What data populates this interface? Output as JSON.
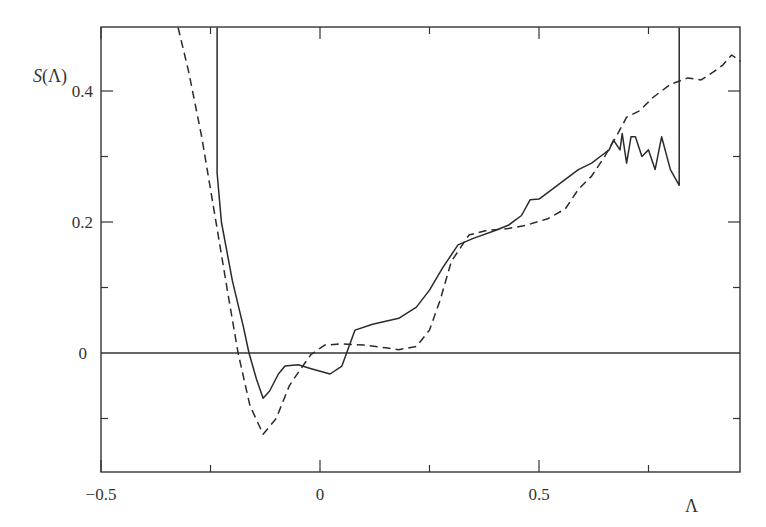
{
  "chart_data": {
    "type": "line",
    "title": "",
    "xlabel": "Λ",
    "ylabel": "S(Λ)",
    "xlim": [
      -0.5,
      0.96
    ],
    "ylim": [
      -0.183,
      0.497
    ],
    "grid": false,
    "legend": null,
    "x_ticks": [
      {
        "value": -0.5,
        "label": "−0.5"
      },
      {
        "value": -0.25,
        "label": ""
      },
      {
        "value": 0,
        "label": "0"
      },
      {
        "value": 0.25,
        "label": ""
      },
      {
        "value": 0.5,
        "label": "0.5"
      },
      {
        "value": 0.75,
        "label": ""
      }
    ],
    "y_ticks": [
      {
        "value": -0.1,
        "label": ""
      },
      {
        "value": 0,
        "label": "0"
      },
      {
        "value": 0.1,
        "label": ""
      },
      {
        "value": 0.2,
        "label": "0.2"
      },
      {
        "value": 0.3,
        "label": ""
      },
      {
        "value": 0.4,
        "label": "0.4"
      }
    ],
    "reference_lines": [
      {
        "axis": "y",
        "value": 0,
        "style": "solid"
      }
    ],
    "series": [
      {
        "name": "solid",
        "style": "solid",
        "x": [
          -0.235,
          -0.235,
          -0.225,
          -0.2,
          -0.175,
          -0.162,
          -0.145,
          -0.13,
          -0.115,
          -0.095,
          -0.08,
          -0.05,
          -0.02,
          0.023,
          0.05,
          0.08,
          0.12,
          0.18,
          0.22,
          0.25,
          0.28,
          0.315,
          0.35,
          0.4,
          0.43,
          0.46,
          0.48,
          0.5,
          0.53,
          0.56,
          0.59,
          0.62,
          0.64,
          0.66,
          0.67,
          0.685,
          0.69,
          0.7,
          0.71,
          0.72,
          0.735,
          0.75,
          0.765,
          0.78,
          0.8,
          0.82,
          0.82
        ],
        "y": [
          0.497,
          0.275,
          0.2,
          0.11,
          0.04,
          0.0,
          -0.04,
          -0.069,
          -0.058,
          -0.032,
          -0.02,
          -0.018,
          -0.024,
          -0.032,
          -0.02,
          0.035,
          0.044,
          0.053,
          0.07,
          0.096,
          0.13,
          0.165,
          0.175,
          0.187,
          0.195,
          0.21,
          0.234,
          0.235,
          0.25,
          0.265,
          0.28,
          0.29,
          0.3,
          0.31,
          0.325,
          0.31,
          0.335,
          0.29,
          0.33,
          0.33,
          0.3,
          0.31,
          0.28,
          0.33,
          0.28,
          0.256,
          0.497
        ]
      },
      {
        "name": "dashed",
        "style": "dashed",
        "x": [
          -0.324,
          -0.3,
          -0.27,
          -0.24,
          -0.21,
          -0.187,
          -0.16,
          -0.13,
          -0.1,
          -0.07,
          -0.046,
          -0.02,
          0.011,
          0.05,
          0.1,
          0.15,
          0.18,
          0.22,
          0.25,
          0.274,
          0.3,
          0.34,
          0.38,
          0.43,
          0.47,
          0.52,
          0.56,
          0.59,
          0.62,
          0.65,
          0.68,
          0.7,
          0.73,
          0.76,
          0.8,
          0.84,
          0.87,
          0.9,
          0.92,
          0.94,
          0.96
        ],
        "y": [
          0.497,
          0.43,
          0.33,
          0.21,
          0.09,
          0.0,
          -0.08,
          -0.124,
          -0.1,
          -0.05,
          -0.026,
          -0.002,
          0.012,
          0.014,
          0.012,
          0.008,
          0.005,
          0.01,
          0.035,
          0.08,
          0.14,
          0.18,
          0.187,
          0.19,
          0.195,
          0.205,
          0.22,
          0.25,
          0.27,
          0.3,
          0.335,
          0.36,
          0.37,
          0.39,
          0.41,
          0.42,
          0.417,
          0.43,
          0.44,
          0.455,
          0.445
        ]
      }
    ]
  }
}
